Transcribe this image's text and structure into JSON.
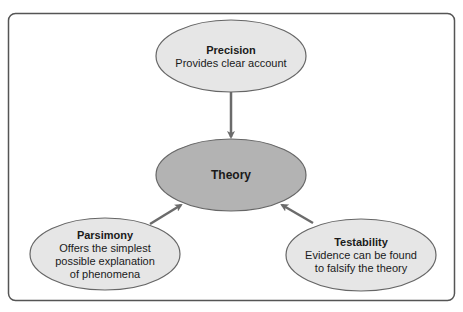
{
  "diagram": {
    "colors": {
      "frame_border": "#555555",
      "outer_fill": "#e6e6e6",
      "center_fill": "#b3b3b3",
      "ellipse_stroke": "#666666",
      "arrow": "#6b6b6b",
      "text": "#1a1a1a"
    },
    "center": {
      "title": "Theory"
    },
    "nodes": [
      {
        "id": "precision",
        "title": "Precision",
        "lines": [
          "Provides clear account"
        ]
      },
      {
        "id": "parsimony",
        "title": "Parsimony",
        "lines": [
          "Offers the simplest",
          "possible explanation",
          "of phenomena"
        ]
      },
      {
        "id": "testability",
        "title": "Testability",
        "lines": [
          "Evidence can be found",
          "to falsify the theory"
        ]
      }
    ],
    "edges": [
      {
        "from": "Precision",
        "to": "Theory"
      },
      {
        "from": "Parsimony",
        "to": "Theory"
      },
      {
        "from": "Testability",
        "to": "Theory"
      }
    ]
  }
}
